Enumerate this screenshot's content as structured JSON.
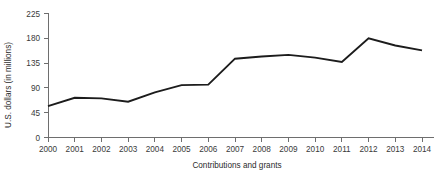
{
  "chart_data": {
    "type": "line",
    "title": "",
    "subtitle": "",
    "xlabel": "Contributions and grants",
    "ylabel": "U.S. dollars (in millions)",
    "x": [
      "2000",
      "2001",
      "2002",
      "2003",
      "2004",
      "2005",
      "2006",
      "2007",
      "2008",
      "2009",
      "2010",
      "2011",
      "2012",
      "2013",
      "2014"
    ],
    "categories": [
      "2000",
      "2001",
      "2002",
      "2003",
      "2004",
      "2005",
      "2006",
      "2007",
      "2008",
      "2009",
      "2010",
      "2011",
      "2012",
      "2013",
      "2014"
    ],
    "values": [
      57,
      72,
      71,
      65,
      82,
      95,
      96,
      143,
      147,
      150,
      145,
      137,
      180,
      167,
      158
    ],
    "series": [
      {
        "name": "Contributions and grants",
        "values": [
          57,
          72,
          71,
          65,
          82,
          95,
          96,
          143,
          147,
          150,
          145,
          137,
          180,
          167,
          158
        ]
      }
    ],
    "ylim": [
      0,
      225
    ],
    "yticks": [
      0,
      45,
      90,
      135,
      180,
      225
    ],
    "ytick_labels": [
      "0",
      "45",
      "90",
      "135",
      "180",
      "225"
    ],
    "xtick_labels": [
      "2000",
      "2001",
      "2002",
      "2003",
      "2004",
      "2005",
      "2006",
      "2007",
      "2008",
      "2009",
      "2010",
      "2011",
      "2012",
      "2013",
      "2014"
    ],
    "grid": false,
    "legend": false,
    "legend_position": "none",
    "line_color": "#1c1c1c",
    "axis_color": "#6e6e6e",
    "text_color": "#3a3a3a",
    "background_color": "#ffffff"
  }
}
